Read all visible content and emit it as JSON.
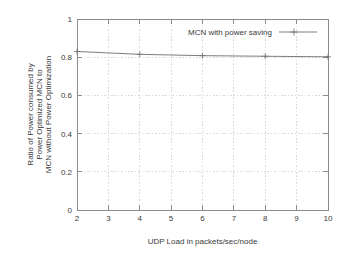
{
  "chart_data": {
    "type": "line",
    "title": "",
    "xlabel": "UDP Load in packets/sec/node",
    "ylabel": "Ratio of Power consumed by Power Optimized MCN to MCN without Power Optimization",
    "ylabel_lines": [
      "Ratio of Power consumed by",
      "Power Optimized MCN to",
      "MCN without Power Optimization"
    ],
    "xlim": [
      2,
      10
    ],
    "ylim": [
      0,
      1
    ],
    "xticks": [
      2,
      3,
      4,
      5,
      6,
      7,
      8,
      9,
      10
    ],
    "xtick_labels": [
      "2",
      "3",
      "4",
      "5",
      "6",
      "7",
      "8",
      "9",
      "10"
    ],
    "yticks": [
      0,
      0.2,
      0.4,
      0.6,
      0.8,
      1
    ],
    "ytick_labels": [
      "0",
      "0.2",
      "0.4",
      "0.6",
      "0.8",
      "1"
    ],
    "grid": true,
    "legend_position": "top-right-inside",
    "series": [
      {
        "name": "MCN with power saving",
        "marker": "plus",
        "color": "#6e6e6e",
        "x": [
          2,
          4,
          6,
          8,
          10
        ],
        "values": [
          0.83,
          0.815,
          0.808,
          0.805,
          0.802
        ]
      }
    ]
  },
  "legend": {
    "entries": [
      {
        "label": "MCN with power saving"
      }
    ]
  },
  "axes": {
    "x_title": "UDP Load in packets/sec/node",
    "y_title_line1": "Ratio of Power consumed by",
    "y_title_line2": "Power Optimized MCN to",
    "y_title_line3": "MCN without Power Optimization"
  },
  "ticks": {
    "x": [
      "2",
      "3",
      "4",
      "5",
      "6",
      "7",
      "8",
      "9",
      "10"
    ],
    "y": [
      "0",
      "0.2",
      "0.4",
      "0.6",
      "0.8",
      "1"
    ]
  }
}
